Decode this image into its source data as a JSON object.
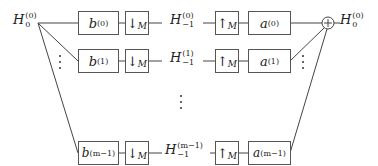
{
  "diagram": {
    "input_label": {
      "base": "H",
      "sup": "(0)",
      "sub": "0"
    },
    "output_label": {
      "base": "H",
      "sup": "(0)",
      "sub": "0"
    },
    "summer_symbol": "+",
    "rows": [
      {
        "analysis_filter": {
          "base": "b",
          "sup": "(0)"
        },
        "downsampler": {
          "arrow": "↓",
          "factor": "M"
        },
        "intermediate": {
          "base": "H",
          "sup": "(0)",
          "sub": "−1"
        },
        "upsampler": {
          "arrow": "↑",
          "factor": "M"
        },
        "synthesis_filter": {
          "base": "a",
          "sup": "(0)"
        }
      },
      {
        "analysis_filter": {
          "base": "b",
          "sup": "(1)"
        },
        "downsampler": {
          "arrow": "↓",
          "factor": "M"
        },
        "intermediate": {
          "base": "H",
          "sup": "(1)",
          "sub": "−1"
        },
        "upsampler": {
          "arrow": "↑",
          "factor": "M"
        },
        "synthesis_filter": {
          "base": "a",
          "sup": "(1)"
        }
      },
      {
        "analysis_filter": {
          "base": "b",
          "sup": "(m−1)"
        },
        "downsampler": {
          "arrow": "↓",
          "factor": "M"
        },
        "intermediate": {
          "base": "H",
          "sup": "(m−1)",
          "sub": "−1"
        },
        "upsampler": {
          "arrow": "↑",
          "factor": "M"
        },
        "synthesis_filter": {
          "base": "a",
          "sup": "(m−1)"
        }
      }
    ]
  }
}
